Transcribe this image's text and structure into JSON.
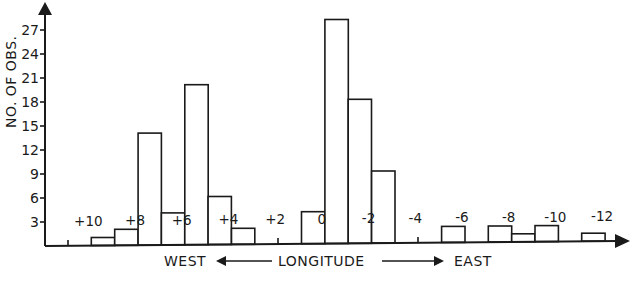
{
  "chart_data": {
    "type": "bar",
    "title": "",
    "xlabel": "LONGITUDE",
    "xlabel_left": "WEST",
    "xlabel_right": "EAST",
    "ylabel": "NO. OF OBS.",
    "ylim": [
      0,
      30
    ],
    "yticks": [
      3,
      6,
      9,
      12,
      15,
      18,
      21,
      24,
      27
    ],
    "xtick_labels": [
      "+10",
      "+8",
      "+6",
      "+4",
      "+2",
      "0",
      "-2",
      "-4",
      "-6",
      "-8",
      "-10",
      "-12"
    ],
    "xlim": [
      11,
      -12
    ],
    "grid": false,
    "legend": null,
    "bin_width_deg": 1,
    "bins": [
      {
        "from": 10,
        "to": 9,
        "count": 1
      },
      {
        "from": 9,
        "to": 8,
        "count": 2
      },
      {
        "from": 8,
        "to": 7,
        "count": 14
      },
      {
        "from": 7,
        "to": 6,
        "count": 4
      },
      {
        "from": 6,
        "to": 5,
        "count": 20
      },
      {
        "from": 5,
        "to": 4,
        "count": 6
      },
      {
        "from": 4,
        "to": 3,
        "count": 2
      },
      {
        "from": 1,
        "to": 0,
        "count": 4
      },
      {
        "from": 0,
        "to": -1,
        "count": 28
      },
      {
        "from": -1,
        "to": -2,
        "count": 18
      },
      {
        "from": -2,
        "to": -3,
        "count": 9
      },
      {
        "from": -5,
        "to": -6,
        "count": 2
      },
      {
        "from": -7,
        "to": -8,
        "count": 2
      },
      {
        "from": -8,
        "to": -9,
        "count": 1
      },
      {
        "from": -9,
        "to": -10,
        "count": 2
      },
      {
        "from": -11,
        "to": -12,
        "count": 1
      }
    ]
  },
  "colors": {
    "ink": "#1a1a1a",
    "background": "#ffffff",
    "bar_fill": "#ffffff"
  }
}
